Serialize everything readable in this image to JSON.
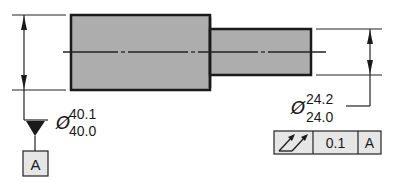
{
  "drawing": {
    "type": "engineering-drawing",
    "subject": "stepped shaft with parallelism tolerance",
    "colors": {
      "part_fill": "#adadad",
      "outline": "#1a1a1a",
      "line": "#222222",
      "frame_fill": "#e6e6e6",
      "background": "#ffffff"
    },
    "large_diameter": {
      "symbol": "Ø",
      "upper_limit": "40.1",
      "lower_limit": "40.0"
    },
    "small_diameter": {
      "symbol": "Ø",
      "upper_limit": "24.2",
      "lower_limit": "24.0"
    },
    "datum": {
      "label": "A"
    },
    "feature_control_frame": {
      "characteristic_icon": "total-runout-icon",
      "tolerance": "0.1",
      "datum_reference": "A"
    }
  }
}
